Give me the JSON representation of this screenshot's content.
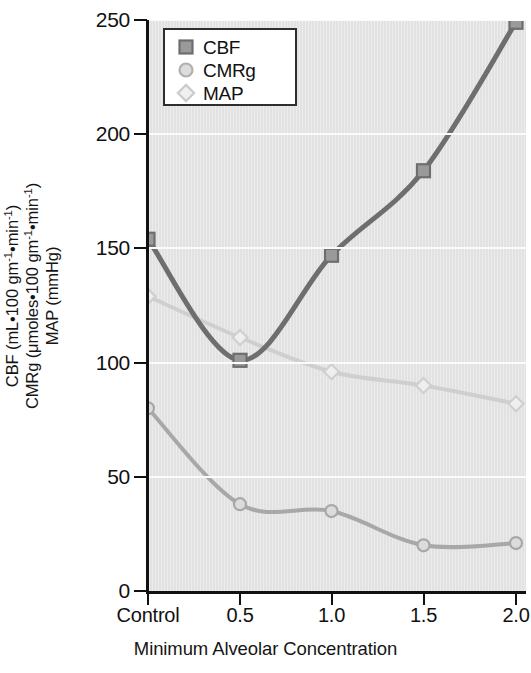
{
  "chart_data": {
    "type": "line",
    "title": "",
    "xlabel": "Minimum Alveolar Concentration",
    "ylabel_lines": [
      "CBF (mL•100 gm-1•min-1)",
      "CMRg (μmoles•100 gm-1•min-1)",
      "MAP (mmHg)"
    ],
    "categories": [
      "Control",
      "0.5",
      "1.0",
      "1.5",
      "2.0"
    ],
    "x_positions": [
      0,
      1,
      2,
      3,
      4
    ],
    "ylim": [
      0,
      250
    ],
    "yticks": [
      0,
      50,
      100,
      150,
      200,
      250
    ],
    "ytick_labels": [
      "0",
      "50",
      "100",
      "150",
      "200",
      "250"
    ],
    "grid": "horizontal",
    "legend_position": "top-left",
    "series": [
      {
        "name": "CBF",
        "marker": "square",
        "color": "#808080",
        "line_color": "#6e6e6e",
        "values": [
          154,
          101,
          147,
          184,
          249
        ]
      },
      {
        "name": "CMRg",
        "marker": "circle",
        "color": "#b5b5b5",
        "line_color": "#a8a8a8",
        "values": [
          80,
          38,
          35,
          20,
          21
        ]
      },
      {
        "name": "MAP",
        "marker": "diamond",
        "color": "#d8d8d8",
        "line_color": "#cfcfcf",
        "values": [
          129,
          111,
          96,
          90,
          82
        ]
      }
    ]
  },
  "ylabel": {
    "line1_a": "CBF (mL•100 gm",
    "line1_sup": "-1",
    "line1_b": "•min",
    "line1_sup2": "-1",
    "line1_c": ")",
    "line2_a": "CMRg (μmoles•100 gm",
    "line2_sup": "-1",
    "line2_b": "•min",
    "line2_sup2": "-1",
    "line2_c": ")",
    "line3": "MAP (mmHg)"
  },
  "legend": {
    "items": [
      {
        "label": "CBF",
        "marker": "square"
      },
      {
        "label": "CMRg",
        "marker": "circle"
      },
      {
        "label": "MAP",
        "marker": "diamond"
      }
    ]
  },
  "axes": {
    "x_title": "Minimum Alveolar Concentration",
    "x_tick_labels": [
      "Control",
      "0.5",
      "1.0",
      "1.5",
      "2.0"
    ],
    "y_tick_labels": [
      "250",
      "200",
      "150",
      "100",
      "50",
      "0"
    ]
  },
  "colors": {
    "plot_background": "#e2e2e2",
    "gridline": "#fbfbfb",
    "axis": "#111111",
    "cbf": "#808080",
    "cmrg": "#b5b5b5",
    "map": "#d8d8d8"
  }
}
